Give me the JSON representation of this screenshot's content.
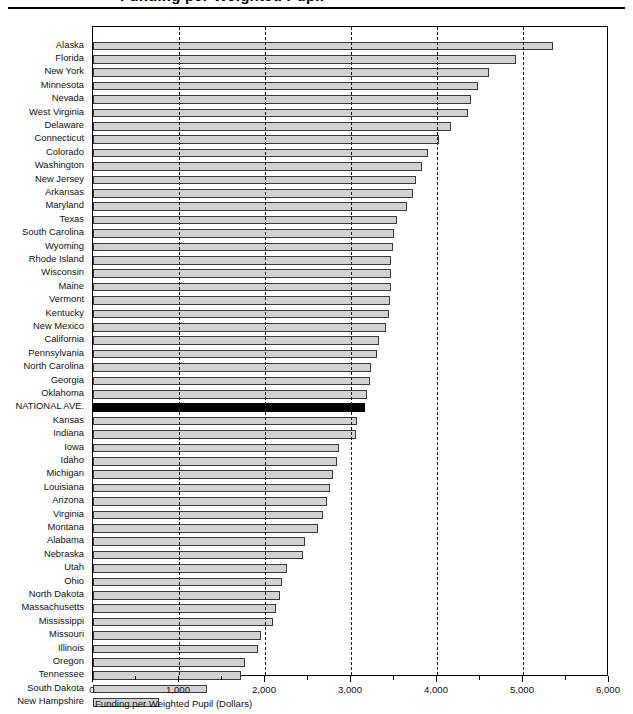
{
  "figure": {
    "title_partial": "Funding per Weighted Pupil",
    "title_visible": false
  },
  "chart_data": {
    "type": "bar",
    "orientation": "horizontal",
    "title": "",
    "xlabel": "Funding per Weighted Pupil (Dollars)",
    "ylabel": "",
    "xlim": [
      0,
      6000
    ],
    "xticks": [
      0,
      1000,
      2000,
      3000,
      4000,
      5000,
      6000
    ],
    "xtick_labels": [
      "0",
      "1,000",
      "2,000",
      "3,000",
      "4,000",
      "5,000",
      "6,000"
    ],
    "minor_tick_interval": 500,
    "grid": "vertical-dashed-at-major-ticks",
    "legend": null,
    "highlight_category": "NATIONAL AVE.",
    "highlight_color": "#000000",
    "bar_color": "#d2d2d2",
    "bar_edge_color": "#3a3a3a",
    "categories": [
      "Alaska",
      "Florida",
      "New York",
      "Minnesota",
      "Nevada",
      "West Virginia",
      "Delaware",
      "Connecticut",
      "Colorado",
      "Washington",
      "New Jersey",
      "Arkansas",
      "Maryland",
      "Texas",
      "South Carolina",
      "Wyoming",
      "Rhode Island",
      "Wisconsin",
      "Maine",
      "Vermont",
      "Kentucky",
      "New Mexico",
      "California",
      "Pennsylvania",
      "North Carolina",
      "Georgia",
      "Oklahoma",
      "NATIONAL AVE.",
      "Kansas",
      "Indiana",
      "Iowa",
      "Idaho",
      "Michigan",
      "Louisiana",
      "Arizona",
      "Virginia",
      "Montana",
      "Alabama",
      "Nebraska",
      "Utah",
      "Ohio",
      "North Dakota",
      "Massachusetts",
      "Mississippi",
      "Missouri",
      "Illinois",
      "Oregon",
      "Tennessee",
      "South Dakota",
      "New Hampshire"
    ],
    "values": [
      5350,
      4920,
      4610,
      4480,
      4390,
      4360,
      4160,
      4020,
      3900,
      3830,
      3760,
      3720,
      3650,
      3540,
      3500,
      3490,
      3470,
      3470,
      3460,
      3450,
      3440,
      3410,
      3330,
      3300,
      3230,
      3220,
      3190,
      3163,
      3070,
      3060,
      2860,
      2840,
      2790,
      2760,
      2720,
      2680,
      2620,
      2470,
      2440,
      2260,
      2200,
      2180,
      2130,
      2090,
      1950,
      1920,
      1770,
      1720,
      1330,
      770
    ]
  }
}
